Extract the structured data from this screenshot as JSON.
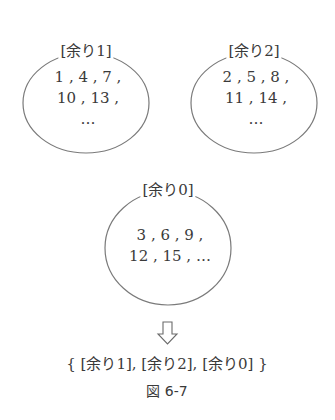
{
  "figure": {
    "caption": "図 6-7",
    "sets": [
      {
        "label": "[余り1]",
        "line1": "1 , 4 , 7 ,",
        "line2": "10 , 13 ,",
        "line3": "…"
      },
      {
        "label": "[余り2]",
        "line1": "2 , 5 , 8 ,",
        "line2": "11 , 14 ,",
        "line3": "…"
      },
      {
        "label": "[余り0]",
        "line1": "3 , 6 , 9 ,",
        "line2": "12 , 15 , …",
        "line3": ""
      }
    ],
    "arrow": "⇩",
    "result": "{ [余り1], [余り2], [余り0] }",
    "stroke_color": "#777777"
  }
}
